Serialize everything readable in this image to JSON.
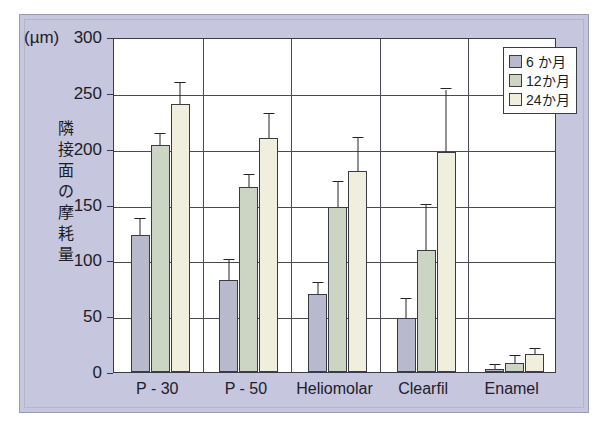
{
  "figure": {
    "unit_label": "(µm)",
    "y_axis_title_chars": [
      "隣",
      "接",
      "面",
      "の",
      "摩",
      "耗",
      "量"
    ],
    "background_color": "#c6c6de",
    "plot_background_color": "#ffffff",
    "axis_color": "#3b3b47"
  },
  "legend": {
    "position": "top-right-inside",
    "entries": [
      {
        "label": "6 か月",
        "color": "#b9b9cd"
      },
      {
        "label": "12か月",
        "color": "#ccd5c4"
      },
      {
        "label": "24か月",
        "color": "#f0eedd"
      }
    ]
  },
  "chart_data": {
    "type": "bar",
    "title": "",
    "xlabel": "",
    "ylabel": "隣接面の摩耗量",
    "unit": "µm",
    "ylim": [
      0,
      300
    ],
    "yticks": [
      0,
      50,
      100,
      150,
      200,
      250,
      300
    ],
    "ytick_labels": [
      "0",
      "50",
      "100",
      "150",
      "200",
      "250",
      "300"
    ],
    "grid": true,
    "legend_position": "upper right",
    "error_bars": "upper-only",
    "categories": [
      "P - 30",
      "P - 50",
      "Heliomolar",
      "Clearfil",
      "Enamel"
    ],
    "series": [
      {
        "name": "6 か月",
        "color": "#b9b9cd",
        "values": [
          123,
          82,
          70,
          48,
          3
        ],
        "errors": [
          14,
          18,
          10,
          17,
          3
        ]
      },
      {
        "name": "12か月",
        "color": "#ccd5c4",
        "values": [
          203,
          166,
          148,
          109,
          8
        ],
        "errors": [
          10,
          10,
          22,
          41,
          6
        ]
      },
      {
        "name": "24か月",
        "color": "#f0eedd",
        "values": [
          240,
          210,
          180,
          197,
          16
        ],
        "errors": [
          19,
          21,
          30,
          56,
          5
        ]
      }
    ]
  }
}
